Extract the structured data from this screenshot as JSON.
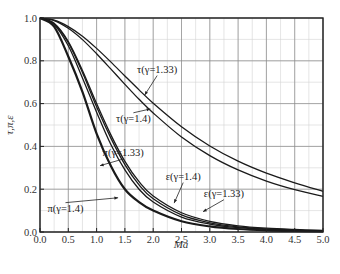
{
  "chart_data": {
    "type": "line",
    "title": "",
    "xlabel": "Ma",
    "ylabel": "τ,π,ε",
    "xlim": [
      0,
      5
    ],
    "ylim": [
      0,
      1
    ],
    "x_ticks": [
      "0.0",
      "0.5",
      "1.0",
      "1.5",
      "2.0",
      "2.5",
      "3.0",
      "3.5",
      "4.0",
      "4.5",
      "5.0"
    ],
    "y_ticks": [
      "0.0",
      "0.2",
      "0.4",
      "0.6",
      "0.8",
      "1.0"
    ],
    "grid": {
      "major": true,
      "minor": true,
      "major_x_step": 0.5,
      "major_y_step": 0.2,
      "minor_x_step": 0.25,
      "minor_y_step": 0.1
    },
    "legend": "none (inline labels with arrows)",
    "x": [
      0,
      0.25,
      0.5,
      0.75,
      1.0,
      1.25,
      1.5,
      1.75,
      2.0,
      2.5,
      3.0,
      3.5,
      4.0,
      4.5,
      5.0
    ],
    "series": [
      {
        "name": "τ(γ=1.33)",
        "label": "τ(γ=1.33)",
        "width": 1.3,
        "values": [
          1.0,
          0.99,
          0.96,
          0.915,
          0.858,
          0.795,
          0.729,
          0.664,
          0.602,
          0.492,
          0.402,
          0.331,
          0.275,
          0.23,
          0.19
        ]
      },
      {
        "name": "τ(γ=1.4)",
        "label": "τ(γ=1.4)",
        "width": 1.3,
        "values": [
          1.0,
          0.988,
          0.952,
          0.899,
          0.833,
          0.762,
          0.69,
          0.62,
          0.556,
          0.444,
          0.357,
          0.29,
          0.238,
          0.198,
          0.167
        ]
      },
      {
        "name": "π(γ=1.33)",
        "label": "π(γ=1.33)",
        "width": 1.3,
        "values": [
          1.0,
          0.97,
          0.87,
          0.72,
          0.56,
          0.41,
          0.29,
          0.2,
          0.14,
          0.07,
          0.037,
          0.02,
          0.012,
          0.007,
          0.004
        ]
      },
      {
        "name": "ε(γ=1.4)",
        "label": "ε(γ=1.4)",
        "width": 1.3,
        "values": [
          1.0,
          0.972,
          0.885,
          0.745,
          0.585,
          0.44,
          0.315,
          0.22,
          0.155,
          0.08,
          0.043,
          0.024,
          0.014,
          0.009,
          0.006
        ]
      },
      {
        "name": "ε(γ=1.33)",
        "label": "ε(γ=1.33)",
        "width": 1.3,
        "values": [
          1.0,
          0.975,
          0.89,
          0.755,
          0.6,
          0.455,
          0.33,
          0.235,
          0.168,
          0.09,
          0.05,
          0.029,
          0.018,
          0.012,
          0.008
        ]
      },
      {
        "name": "π(γ=1.4)",
        "label": "π(γ=1.4)",
        "width": 2.2,
        "values": [
          1.0,
          0.96,
          0.82,
          0.655,
          0.46,
          0.31,
          0.2,
          0.14,
          0.1,
          0.05,
          0.026,
          0.014,
          0.008,
          0.005,
          0.003
        ]
      }
    ],
    "annotations": [
      {
        "text": "τ(γ=1.33)",
        "tx": 2.07,
        "ty": 0.745,
        "ax": 1.85,
        "ay": 0.64
      },
      {
        "text": "τ(γ=1.4)",
        "tx": 1.65,
        "ty": 0.515,
        "ax": 1.95,
        "ay": 0.575
      },
      {
        "text": "π(γ=1.33)",
        "tx": 1.47,
        "ty": 0.355,
        "ax": 1.06,
        "ay": 0.31
      },
      {
        "text": "ε(γ=1.4)",
        "tx": 2.53,
        "ty": 0.245,
        "ax": 2.37,
        "ay": 0.135
      },
      {
        "text": "ε(γ=1.33)",
        "tx": 3.25,
        "ty": 0.165,
        "ax": 2.88,
        "ay": 0.095
      },
      {
        "text": "π(γ=1.4)",
        "tx": 0.45,
        "ty": 0.095,
        "ax": 1.38,
        "ay": 0.16
      }
    ]
  }
}
